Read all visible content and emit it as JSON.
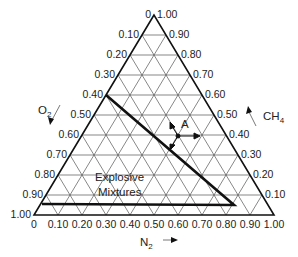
{
  "diagram": {
    "type": "ternary",
    "axes": {
      "left": {
        "label": "O2",
        "label_main": "O",
        "label_sub": "2",
        "ticks": [
          "0",
          "0.10",
          "0.20",
          "0.30",
          "0.40",
          "0.50",
          "0.60",
          "0.70",
          "0.80",
          "0.90",
          "1.00"
        ]
      },
      "right": {
        "label": "CH4",
        "label_main": "CH",
        "label_sub": "4",
        "ticks": [
          "1.00",
          "0.90",
          "0.80",
          "0.70",
          "0.60",
          "0.50",
          "0.40",
          "0.30",
          "0.20",
          "0.10"
        ]
      },
      "bottom": {
        "label": "N2",
        "label_main": "N",
        "label_sub": "2",
        "ticks": [
          "0",
          "0.10",
          "0.20",
          "0.30",
          "0.40",
          "0.50",
          "0.60",
          "0.70",
          "0.80",
          "0.90",
          "1.00"
        ]
      }
    },
    "region_label_line1": "Explosive",
    "region_label_line2": "Mixtures",
    "point_label": "A"
  }
}
